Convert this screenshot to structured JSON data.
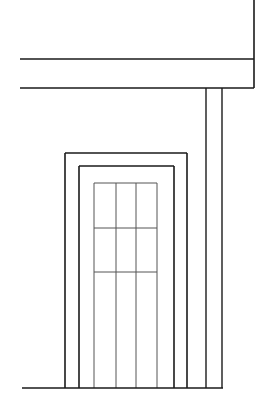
{
  "drawing": {
    "type": "architectural-elevation",
    "subject": "entry door with porch post and overhang",
    "canvas": {
      "width": 259,
      "height": 415,
      "background": "#ffffff"
    },
    "stroke_color": "#1a1a1a",
    "light_stroke_color": "#555555",
    "overhang": {
      "top_y": 59,
      "bottom_y": 88,
      "left_x": 20,
      "right_x": 254
    },
    "post": {
      "left_x": 206,
      "right_x": 222,
      "top_y": 88,
      "bottom_y": 388
    },
    "door_outer_frame": {
      "left_x": 65,
      "right_x": 187,
      "top_y": 153
    },
    "door_inner_frame": {
      "left_x": 79,
      "right_x": 174,
      "top_y": 166
    },
    "glass_panel": {
      "left_x": 94,
      "right_x": 157,
      "top_y": 183,
      "bottom_y": 388,
      "vertical_mullions_x": [
        116,
        136
      ],
      "horizontal_mullions_y": [
        228,
        272
      ]
    },
    "ground_line": {
      "y": 388,
      "left_x": 22,
      "right_x": 223
    }
  }
}
